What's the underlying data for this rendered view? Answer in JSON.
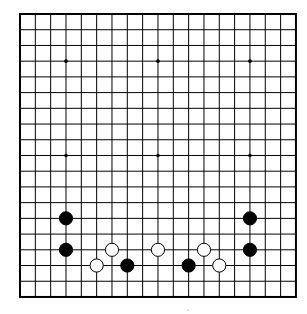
{
  "board": {
    "size": 19,
    "origin_x": 20,
    "origin_y": 14,
    "cell_w": 15.33,
    "cell_h": 15.72,
    "line_color": "#000000",
    "background": "#ffffff",
    "border_width": 2,
    "line_width": 1,
    "star_points": [
      {
        "col": 3,
        "row": 3
      },
      {
        "col": 9,
        "row": 3
      },
      {
        "col": 15,
        "row": 3
      },
      {
        "col": 3,
        "row": 9
      },
      {
        "col": 9,
        "row": 9
      },
      {
        "col": 15,
        "row": 9
      }
    ],
    "stones": [
      {
        "color": "black",
        "col": 3,
        "row": 13
      },
      {
        "color": "black",
        "col": 3,
        "row": 15
      },
      {
        "color": "white",
        "col": 6,
        "row": 15
      },
      {
        "color": "white",
        "col": 5,
        "row": 16
      },
      {
        "color": "black",
        "col": 7,
        "row": 16
      },
      {
        "color": "white",
        "col": 9,
        "row": 15
      },
      {
        "color": "white",
        "col": 12,
        "row": 15
      },
      {
        "color": "black",
        "col": 11,
        "row": 16
      },
      {
        "color": "white",
        "col": 13,
        "row": 16
      },
      {
        "color": "black",
        "col": 15,
        "row": 13
      },
      {
        "color": "black",
        "col": 15,
        "row": 15
      }
    ],
    "colors": {
      "black_stone": "#000000",
      "white_stone": "#ffffff",
      "white_stone_outline": "#000000"
    }
  }
}
